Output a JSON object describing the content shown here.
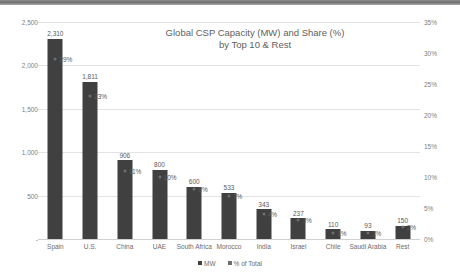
{
  "chart_data": {
    "type": "bar",
    "title": "Global CSP Capacity (MW) and Share (%) by Top 10 & Rest",
    "title_line1": "Global CSP Capacity (MW) and Share (%)",
    "title_line2": "by Top 10 & Rest",
    "xlabel": "",
    "ylabel": "",
    "y2label": "",
    "categories": [
      "Spain",
      "U.S.",
      "China",
      "UAE",
      "South Africa",
      "Morocco",
      "India",
      "Israel",
      "Chile",
      "Saudi Arabia",
      "Rest"
    ],
    "series": [
      {
        "name": "MW",
        "type": "bar",
        "axis": "left",
        "color": "#404040",
        "values": [
          2310,
          1811,
          906,
          800,
          600,
          533,
          343,
          237,
          110,
          93,
          150
        ],
        "labels": [
          "2,310",
          "1,811",
          "906",
          "800",
          "600",
          "533",
          "343",
          "237",
          "110",
          "93",
          "150"
        ]
      },
      {
        "name": "% of Total",
        "type": "scatter",
        "axis": "right",
        "color": "#6d6d6d",
        "values": [
          29,
          23,
          11,
          10,
          8,
          7,
          4,
          3,
          1,
          1,
          2
        ],
        "labels": [
          "29%",
          "23%",
          "11%",
          "10%",
          "8%",
          "7%",
          "4%",
          "3%",
          "1%",
          "1%",
          "2%"
        ]
      }
    ],
    "ylim": [
      0,
      2500
    ],
    "yticks": [
      0,
      500,
      1000,
      1500,
      2000,
      2500
    ],
    "yticklabels": [
      "-",
      "500",
      "1,000",
      "1,500",
      "2,000",
      "2,500"
    ],
    "y2lim": [
      0,
      35
    ],
    "y2ticks": [
      0,
      5,
      10,
      15,
      20,
      25,
      30,
      35
    ],
    "y2ticklabels": [
      "0%",
      "5%",
      "10%",
      "15%",
      "20%",
      "25%",
      "30%",
      "35%"
    ],
    "grid": true,
    "legend_position": "bottom",
    "legend_entries": [
      "MW",
      "% of Total"
    ]
  }
}
